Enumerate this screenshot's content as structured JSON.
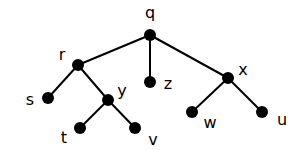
{
  "diagram": {
    "type": "tree",
    "root": "q",
    "nodes": [
      {
        "id": "q",
        "label": "q",
        "x": 150,
        "y": 35,
        "lx": 150,
        "ly": 18,
        "anchor": "middle"
      },
      {
        "id": "r",
        "label": "r",
        "x": 78,
        "y": 65,
        "lx": 62,
        "ly": 60,
        "anchor": "middle"
      },
      {
        "id": "z",
        "label": "z",
        "x": 150,
        "y": 82,
        "lx": 168,
        "ly": 89,
        "anchor": "middle"
      },
      {
        "id": "x",
        "label": "x",
        "x": 228,
        "y": 78,
        "lx": 243,
        "ly": 75,
        "anchor": "middle"
      },
      {
        "id": "s",
        "label": "s",
        "x": 48,
        "y": 98,
        "lx": 30,
        "ly": 105,
        "anchor": "middle"
      },
      {
        "id": "y",
        "label": "y",
        "x": 108,
        "y": 100,
        "lx": 122,
        "ly": 96,
        "anchor": "middle"
      },
      {
        "id": "t",
        "label": "t",
        "x": 80,
        "y": 128,
        "lx": 64,
        "ly": 143,
        "anchor": "middle"
      },
      {
        "id": "v",
        "label": "v",
        "x": 135,
        "y": 128,
        "lx": 153,
        "ly": 145,
        "anchor": "middle"
      },
      {
        "id": "w",
        "label": "w",
        "x": 192,
        "y": 112,
        "lx": 210,
        "ly": 128,
        "anchor": "middle"
      },
      {
        "id": "u",
        "label": "u",
        "x": 262,
        "y": 112,
        "lx": 282,
        "ly": 125,
        "anchor": "middle"
      }
    ],
    "edges": [
      {
        "from": "q",
        "to": "r"
      },
      {
        "from": "q",
        "to": "z"
      },
      {
        "from": "q",
        "to": "x"
      },
      {
        "from": "r",
        "to": "s"
      },
      {
        "from": "r",
        "to": "y"
      },
      {
        "from": "y",
        "to": "t"
      },
      {
        "from": "y",
        "to": "v"
      },
      {
        "from": "x",
        "to": "w"
      },
      {
        "from": "x",
        "to": "u"
      }
    ],
    "node_color": "#000000",
    "edge_color": "#000000"
  }
}
